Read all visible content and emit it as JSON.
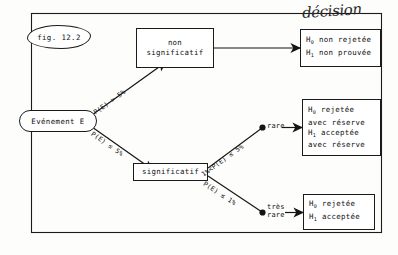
{
  "figure": {
    "tag_label": "fig. 12.2",
    "handwritten_note": "décision"
  },
  "nodes": {
    "event": {
      "label": "Evénement E"
    },
    "non_significatif": {
      "line1": "non",
      "line2": "significatif"
    },
    "significatif": {
      "label": "significatif"
    },
    "rare": {
      "line1": "rare",
      "line2": ""
    },
    "tres_rare": {
      "line1": "très",
      "line2": "rare"
    }
  },
  "edges": {
    "e1": {
      "label": "P(E) > 5%"
    },
    "e2": {
      "label": "P(E) ≤ 5%"
    },
    "e3": {
      "label": "1%<P(E) ≤ 5%"
    },
    "e4": {
      "label": "P(E) ≤ 1%"
    }
  },
  "outcomes": {
    "top": {
      "line1_h": "H",
      "line1_sub": "0",
      "line1_rest": " non rejetée",
      "line2_h": "H",
      "line2_sub": "1",
      "line2_rest": " non prouvée"
    },
    "middle": {
      "line1_h": "H",
      "line1_sub": "0",
      "line1_rest": " rejetée",
      "line2": "avec réserve",
      "line3_h": "H",
      "line3_sub": "1",
      "line3_rest": " acceptée",
      "line4": "avec réserve"
    },
    "bottom": {
      "line1_h": "H",
      "line1_sub": "0",
      "line1_rest": " rejetée",
      "line2_h": "H",
      "line2_sub": "1",
      "line2_rest": " acceptée"
    }
  },
  "colors": {
    "ink": "#1b1b1b",
    "paper": "#fdfdfc"
  }
}
